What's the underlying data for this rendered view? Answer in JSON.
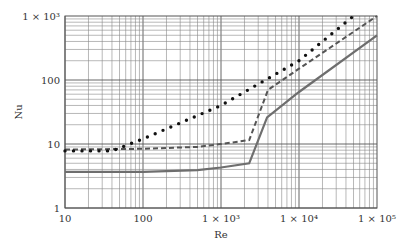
{
  "chart_data": {
    "type": "line",
    "title": "",
    "xlabel": "Re",
    "ylabel": "Nu",
    "xscale": "log",
    "yscale": "log",
    "xlim": [
      10,
      100000
    ],
    "ylim": [
      1,
      1000
    ],
    "grid": true,
    "legend": null,
    "x_tick_labels": [
      "10",
      "100",
      "1 × 10³",
      "1 × 10⁴",
      "1 × 10⁵"
    ],
    "x_ticks": [
      10,
      100,
      1000,
      10000,
      100000
    ],
    "y_tick_labels": [
      "1",
      "10",
      "100",
      "1 × 10³"
    ],
    "y_ticks": [
      1,
      10,
      100,
      1000
    ],
    "series": [
      {
        "name": "solid",
        "style": "solid",
        "color": "#6e6e6e",
        "x": [
          10,
          100,
          500,
          1000,
          2300,
          3900,
          10000,
          100000
        ],
        "y": [
          3.66,
          3.66,
          3.9,
          4.3,
          5.0,
          26,
          65,
          500
        ]
      },
      {
        "name": "dashed",
        "style": "dashed",
        "color": "#555555",
        "x": [
          10,
          100,
          500,
          1000,
          2300,
          4000,
          10000,
          100000
        ],
        "y": [
          8.2,
          8.4,
          9.0,
          10,
          11.5,
          70,
          150,
          1000
        ]
      },
      {
        "name": "dotted",
        "style": "dotted",
        "color": "#111111",
        "x": [
          10,
          40,
          100,
          1000,
          10000,
          50000
        ],
        "y": [
          7.8,
          7.8,
          12,
          40,
          200,
          1000
        ]
      }
    ]
  }
}
